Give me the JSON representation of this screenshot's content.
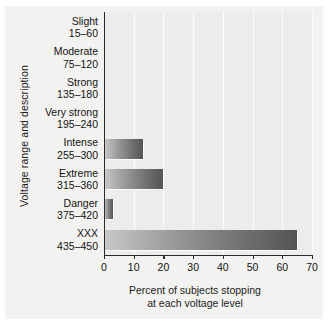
{
  "chart_data": {
    "type": "bar",
    "orientation": "horizontal",
    "title": "",
    "xlabel": "Percent of subjects stopping at each voltage level",
    "xlabel_line1": "Percent of subjects stopping",
    "xlabel_line2": "at each voltage level",
    "ylabel": "Voltage range and description",
    "categories": [
      "Slight",
      "Moderate",
      "Strong",
      "Very strong",
      "Intense",
      "Extreme",
      "Danger",
      "XXX"
    ],
    "category_ranges": [
      "15–60",
      "75–120",
      "135–180",
      "195–240",
      "255–300",
      "315–360",
      "375–420",
      "435–450"
    ],
    "values": [
      0,
      0,
      0,
      0,
      13,
      20,
      3,
      65
    ],
    "xlim": [
      0,
      70
    ],
    "xticks": [
      0,
      10,
      20,
      30,
      40,
      50,
      60,
      70
    ],
    "xtick_labels": [
      "0",
      "10",
      "20",
      "30",
      "40",
      "50",
      "60",
      "70"
    ],
    "grid": "vertical-white",
    "legend": "none",
    "bar_gradient_start": "#c9c9c7",
    "bar_gradient_end": "#545452",
    "plot_background": "#ececea",
    "figure_background": "#f2f2f0",
    "axis_color": "#2b2b2b",
    "text_color": "#141414"
  }
}
